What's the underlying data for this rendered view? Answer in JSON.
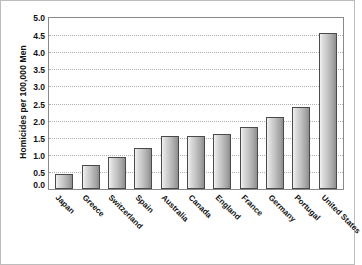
{
  "chart_data": {
    "type": "bar",
    "title": "",
    "xlabel": "",
    "ylabel": "Homicides per 100,000 Men",
    "ylim": [
      0,
      5.0
    ],
    "ytick_labels": [
      "5.0",
      "4.5",
      "4.0",
      "3.5",
      "3.0",
      "2.5",
      "2.0",
      "1.5",
      "1.0",
      "0.5",
      "0.0"
    ],
    "ytick_values": [
      5.0,
      4.5,
      4.0,
      3.5,
      3.0,
      2.5,
      2.0,
      1.5,
      1.0,
      0.5,
      0.0
    ],
    "grid": true,
    "legend": false,
    "categories": [
      "Japan",
      "Greece",
      "Switzerland",
      "Spain",
      "Australia",
      "Canada",
      "England",
      "France",
      "Germany",
      "Portugal",
      "United States"
    ],
    "values": [
      0.45,
      0.7,
      0.95,
      1.2,
      1.55,
      1.55,
      1.6,
      1.8,
      2.1,
      2.4,
      4.55
    ],
    "bar_color": "#c3c3c3",
    "bar_edge_color": "#4a4a4a",
    "gridline_color": "#b0b0b0",
    "axis_color": "#8a8a8a",
    "background_color": "#ffffff"
  }
}
